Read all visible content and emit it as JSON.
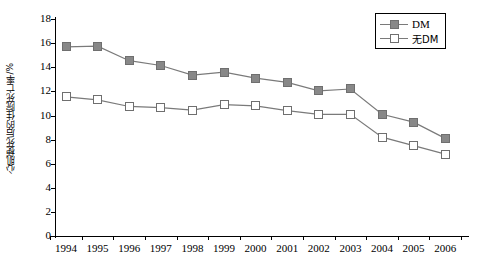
{
  "chart_data": {
    "type": "line",
    "title": "",
    "xlabel": "",
    "ylabel": "心肌梗死后的住院死亡率/%",
    "x": [
      "1994",
      "1995",
      "1996",
      "1997",
      "1998",
      "1999",
      "2000",
      "2001",
      "2002",
      "2003",
      "2004",
      "2005",
      "2006"
    ],
    "categories": [
      "1994",
      "1995",
      "1996",
      "1997",
      "1998",
      "1999",
      "2000",
      "2001",
      "2002",
      "2003",
      "2004",
      "2005",
      "2006"
    ],
    "series": [
      {
        "name": "DM",
        "marker": "filled-square",
        "color": "#888888",
        "values": [
          15.7,
          15.75,
          14.55,
          14.15,
          13.35,
          13.6,
          13.1,
          12.75,
          12.05,
          12.2,
          10.1,
          9.45,
          8.1
        ]
      },
      {
        "name": "无DM",
        "marker": "open-square",
        "color": "#ffffff",
        "values": [
          11.55,
          11.3,
          10.75,
          10.65,
          10.45,
          10.9,
          10.8,
          10.4,
          10.1,
          10.1,
          8.2,
          7.5,
          6.8
        ]
      }
    ],
    "ylim": [
      0,
      18
    ],
    "yticks": [
      0,
      2,
      4,
      6,
      8,
      10,
      12,
      14,
      16,
      18
    ],
    "ytick_labels": [
      "0",
      "2",
      "4",
      "6",
      "8",
      "10",
      "12",
      "14",
      "16",
      "18"
    ],
    "grid": false,
    "legend_position": "top-right",
    "legend_entries": [
      "DM",
      "无DM"
    ]
  },
  "axes": {
    "y_title": "心肌梗死后的住院死亡率/%"
  },
  "legend": {
    "items": [
      {
        "label": "DM"
      },
      {
        "label": "无DM"
      }
    ]
  }
}
